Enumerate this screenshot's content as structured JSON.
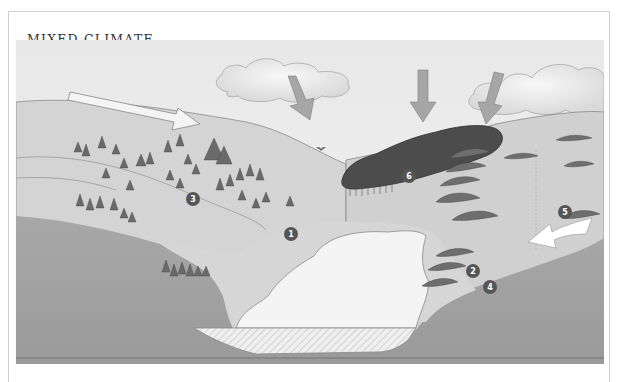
{
  "title": "MIXED CLIMATE",
  "figure": {
    "labels": [
      {
        "id": "1",
        "text": "1"
      },
      {
        "id": "2",
        "text": "2"
      },
      {
        "id": "3",
        "text": "3"
      },
      {
        "id": "4",
        "text": "4"
      },
      {
        "id": "5",
        "text": "5"
      },
      {
        "id": "6",
        "text": "6"
      }
    ],
    "colors": {
      "sky": "#eeeeee",
      "hill": "#d2d2d2",
      "ground_dark": "#9c9c9c",
      "lake": "#f4f4f4",
      "forest": "#4a4a4a",
      "arrow_gray": "#a6a6a6",
      "badge": "#555555"
    }
  }
}
